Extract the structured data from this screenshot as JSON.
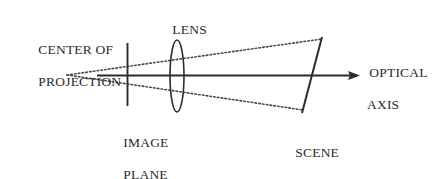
{
  "figure": {
    "type": "optics-ray-diagram",
    "background_color": "#ffffff",
    "stroke_color": "#2b2b2b",
    "labels": {
      "center_of_projection_line1": "CENTER OF",
      "center_of_projection_line2": "PROJECTION",
      "lens": "LENS",
      "optical_axis_line1": "OPTICAL",
      "optical_axis_line2": "AXIS",
      "image_plane_line1": "IMAGE",
      "image_plane_line2": "PLANE",
      "scene_object_line1": "SCENE",
      "scene_object_line2": "OBJECT"
    },
    "elements": {
      "optical_axis": {
        "x1": 97,
        "y1": 75,
        "x2": 360,
        "y2": 75,
        "style": "solid-with-arrowhead"
      },
      "image_plane": {
        "x": 127,
        "y1": 43,
        "y2": 106,
        "style": "solid-vertical"
      },
      "lens": {
        "cx": 177,
        "cy": 76,
        "rx": 7,
        "ry": 36,
        "style": "ellipse-outline"
      },
      "scene_object": {
        "x1": 302,
        "y1": 113,
        "x2": 322,
        "y2": 37,
        "style": "solid-slanted"
      },
      "ray_upper": {
        "x1": 67,
        "y1": 75,
        "x2": 322,
        "y2": 39,
        "style": "dotted"
      },
      "ray_lower": {
        "x1": 67,
        "y1": 75,
        "x2": 303,
        "y2": 110,
        "style": "dotted"
      },
      "center_of_projection_point": {
        "x": 67,
        "y": 75
      }
    }
  }
}
